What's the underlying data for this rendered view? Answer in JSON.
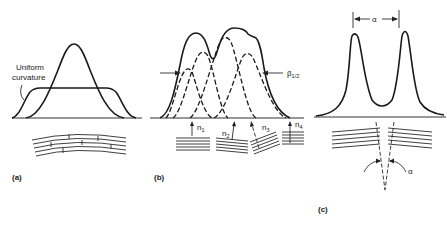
{
  "figure": {
    "panels": [
      {
        "id": "a",
        "label": "(a)",
        "annotation": "Uniform\ncurvature",
        "annotation_lines": [
          "Uniform",
          "curvature"
        ],
        "description": "Single peak vs. flat-topped broadened peak from uniformly curved layers"
      },
      {
        "id": "b",
        "label": "(b)",
        "width_label": "β1/2",
        "width_symbol": "β",
        "width_subscript": "1/2",
        "normals": [
          "n1",
          "n2",
          "n3",
          "n4"
        ],
        "normal_labels": [
          {
            "base": "n",
            "sub": "1"
          },
          {
            "base": "n",
            "sub": "2"
          },
          {
            "base": "n",
            "sub": "3"
          },
          {
            "base": "n",
            "sub": "4"
          }
        ],
        "description": "Composite peak from several sub-grain domains with differing normals"
      },
      {
        "id": "c",
        "label": "(c)",
        "separation_label": "α",
        "angle_label": "α",
        "description": "Two discrete peaks separated by misorientation angle α"
      }
    ]
  }
}
